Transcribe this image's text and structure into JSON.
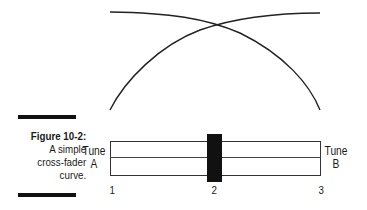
{
  "figure": {
    "number_label": "Figure 10-2:",
    "caption_lines": [
      "A simple",
      "cross-fader",
      "curve."
    ]
  },
  "diagram": {
    "curves": [
      {
        "name": "tune-a-curve",
        "description": "starts high at left, falls to bottom at right"
      },
      {
        "name": "tune-b-curve",
        "description": "starts low at left, rises to high at right"
      }
    ],
    "fader": {
      "left_label_lines": [
        "Tune",
        "A"
      ],
      "right_label_lines": [
        "Tune",
        "B"
      ],
      "position_ticks": [
        "1",
        "2",
        "3"
      ],
      "knob_position": "2"
    }
  }
}
